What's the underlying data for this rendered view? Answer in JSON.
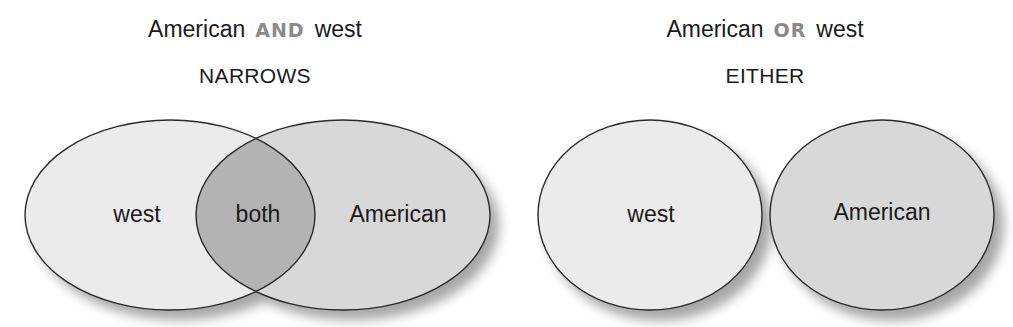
{
  "and_panel": {
    "title_left": "American",
    "operator": "AND",
    "title_right": "west",
    "subtitle": "NARROWS",
    "sets": [
      {
        "label": "west",
        "fill": "#ebebeb"
      },
      {
        "label": "American",
        "fill": "#d8d8d8"
      }
    ],
    "intersection": {
      "label": "both",
      "fill": "#b3b3b3"
    }
  },
  "or_panel": {
    "title_left": "American",
    "operator": "OR",
    "title_right": "west",
    "subtitle": "EITHER",
    "sets": [
      {
        "label": "west",
        "fill": "#ebebeb"
      },
      {
        "label": "American",
        "fill": "#d8d8d8"
      }
    ]
  },
  "colors": {
    "operator_text": "#8a8a8a",
    "outline": "#2a2a2a",
    "text": "#1a1a1a"
  }
}
